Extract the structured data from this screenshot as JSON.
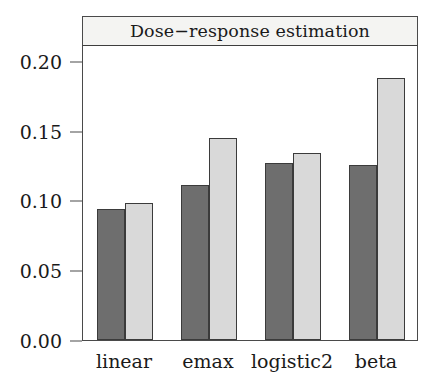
{
  "chart_data": {
    "type": "bar",
    "title": "Dose−response estimation",
    "xlabel": "",
    "ylabel": "",
    "categories": [
      "linear",
      "emax",
      "logistic2",
      "beta"
    ],
    "series": [
      {
        "name": "dark",
        "color": "#6e6e6e",
        "values": [
          0.094,
          0.111,
          0.127,
          0.125
        ]
      },
      {
        "name": "light",
        "color": "#d9d9d9",
        "values": [
          0.098,
          0.145,
          0.134,
          0.188
        ]
      }
    ],
    "ylim": [
      0.0,
      0.212
    ],
    "yticks": [
      0.0,
      0.05,
      0.1,
      0.15,
      0.2
    ],
    "ytick_labels": [
      "0.00",
      "0.05",
      "0.10",
      "0.15",
      "0.20"
    ],
    "grid": false,
    "legend": "none",
    "grouped": true,
    "bar_border_color": "#3b3b3b",
    "panel_border_color": "#4a4a4a",
    "strip_background": "#f4f4f2"
  }
}
